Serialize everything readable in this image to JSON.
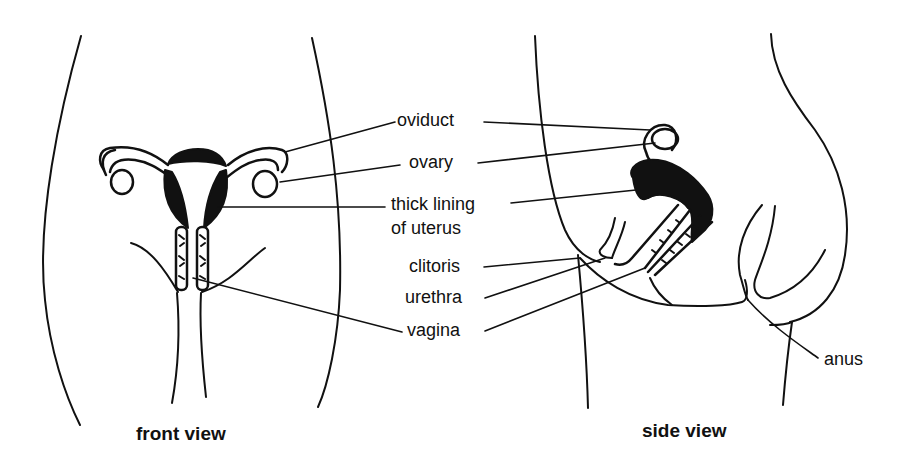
{
  "diagram": {
    "labels": {
      "oviduct": "oviduct",
      "ovary": "ovary",
      "lining_line1": "thick lining",
      "lining_line2": "of uterus",
      "clitoris": "clitoris",
      "urethra": "urethra",
      "vagina": "vagina",
      "anus": "anus"
    },
    "captions": {
      "front": "front view",
      "side": "side view"
    },
    "colors": {
      "ink": "#111111",
      "background": "#ffffff"
    }
  }
}
